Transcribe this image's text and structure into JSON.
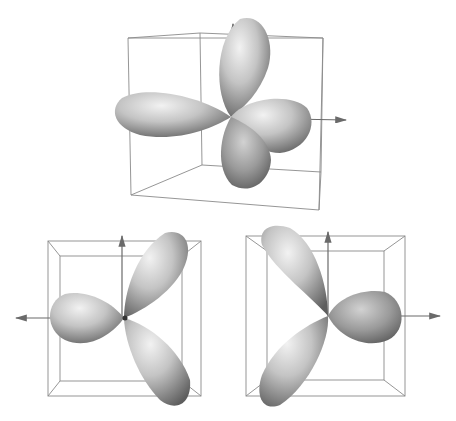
{
  "figure": {
    "panels": [
      {
        "id": "top",
        "view": "perspective",
        "lobes": 4,
        "axis_arrow": "right"
      },
      {
        "id": "bottom-left",
        "view": "front",
        "lobes": 3,
        "axis_arrow": "left"
      },
      {
        "id": "bottom-right",
        "view": "front-mirrored",
        "lobes": 3,
        "axis_arrow": "right"
      }
    ]
  },
  "colors": {
    "background": "#ffffff",
    "box_line": "#8a8a8a",
    "axis": "#6a6a6a",
    "lobe_light": "#e6e6e6",
    "lobe_mid": "#b3b3b3",
    "lobe_dark": "#6e6e6e"
  }
}
